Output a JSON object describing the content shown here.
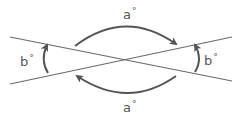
{
  "diagram": {
    "colors": {
      "line": "#6a6a6a",
      "arrow": "#555555",
      "text": "#555555"
    },
    "labels": {
      "top": {
        "var": "a",
        "unit": "°"
      },
      "bottom": {
        "var": "a",
        "unit": "°"
      },
      "left": {
        "var": "b",
        "unit": "°"
      },
      "right": {
        "var": "b",
        "unit": "°"
      }
    }
  }
}
